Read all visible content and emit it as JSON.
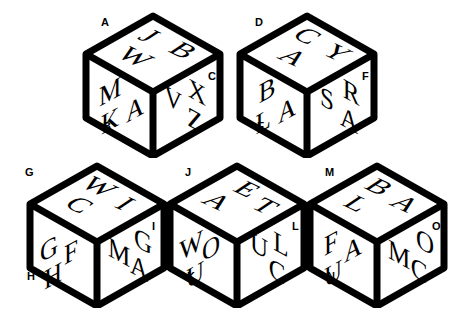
{
  "figure": {
    "background_color": "#ffffff",
    "ink_color": "#000000"
  },
  "cubes": [
    {
      "id": "cube-1",
      "x": 78,
      "y": 8,
      "top_face": {
        "letters": [
          "J",
          "B",
          "W"
        ]
      },
      "left_face": {
        "letters": [
          "M",
          "K",
          "A"
        ]
      },
      "right_face": {
        "letters": [
          "V",
          "X",
          "Z"
        ]
      },
      "labels": {
        "top_left": "A",
        "bottom_left": "B",
        "right": "C"
      }
    },
    {
      "id": "cube-2",
      "x": 232,
      "y": 8,
      "top_face": {
        "letters": [
          "C",
          "Y",
          "A"
        ]
      },
      "left_face": {
        "letters": [
          "B",
          "L",
          "A"
        ]
      },
      "right_face": {
        "letters": [
          "S",
          "R",
          "A"
        ]
      },
      "labels": {
        "top_left": "D",
        "bottom_left": "E",
        "right": "F"
      }
    },
    {
      "id": "cube-3",
      "x": 22,
      "y": 158,
      "top_face": {
        "letters": [
          "W",
          "I",
          "C"
        ]
      },
      "left_face": {
        "letters": [
          "G",
          "F",
          "H"
        ]
      },
      "right_face": {
        "letters": [
          "G",
          "M",
          "A"
        ]
      },
      "labels": {
        "top_left": "G",
        "bottom_left": "H",
        "right": "I"
      }
    },
    {
      "id": "cube-4",
      "x": 162,
      "y": 158,
      "top_face": {
        "letters": [
          "E",
          "T",
          "A"
        ]
      },
      "left_face": {
        "letters": [
          "W",
          "O",
          "U"
        ]
      },
      "right_face": {
        "letters": [
          "U",
          "L",
          "C"
        ]
      },
      "labels": {
        "top_left": "J",
        "bottom_left": "K",
        "right": "L"
      }
    },
    {
      "id": "cube-5",
      "x": 302,
      "y": 158,
      "top_face": {
        "letters": [
          "B",
          "A",
          "L"
        ]
      },
      "left_face": {
        "letters": [
          "F",
          "A",
          "U"
        ]
      },
      "right_face": {
        "letters": [
          "O",
          "M",
          "C"
        ]
      },
      "labels": {
        "top_left": "M",
        "bottom_left": "N",
        "right": "O"
      }
    }
  ]
}
